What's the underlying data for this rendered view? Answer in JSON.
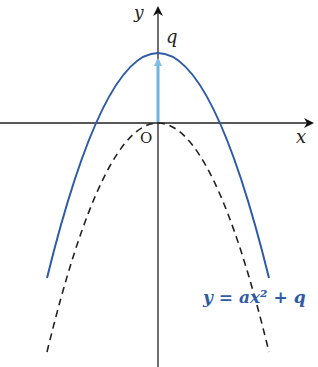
{
  "diagram": {
    "type": "function-graph",
    "axes": {
      "x_label": "x",
      "y_label": "y",
      "origin_label": "O"
    },
    "labels": {
      "vertex_shift": "q",
      "equation": "y = ax² + q"
    },
    "curves": [
      {
        "name": "shifted-parabola",
        "equation": "y = ax² + q",
        "style": "solid",
        "color": "#2f5aa8"
      },
      {
        "name": "base-parabola",
        "equation": "y = ax²",
        "style": "dashed",
        "color": "#222222"
      }
    ],
    "shift_arrow": {
      "from": "O",
      "to": "vertex (0, q)",
      "color": "#6fb3e0"
    },
    "colors": {
      "axis": "#222222",
      "solid_curve": "#2f5aa8",
      "dashed_curve": "#222222",
      "arrow": "#6fb3e0",
      "equation_text": "#2f5aa8"
    }
  }
}
